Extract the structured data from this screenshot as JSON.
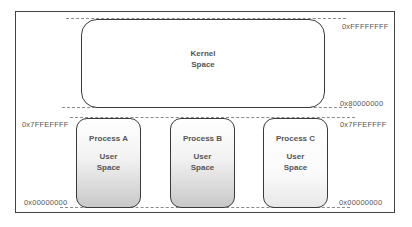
{
  "diagram": {
    "kernel": {
      "line1": "Kernel",
      "line2": "Space"
    },
    "processes": [
      {
        "name": "Process A",
        "line1": "User",
        "line2": "Space"
      },
      {
        "name": "Process B",
        "line1": "User",
        "line2": "Space"
      },
      {
        "name": "Process C",
        "line1": "User",
        "line2": "Space"
      }
    ],
    "addresses": {
      "kernel_top": "0xFFFFFFFF",
      "kernel_bottom": "0x80000000",
      "user_top_left": "0x7FFEFFFF",
      "user_top_right": "0x7FFEFFFF",
      "user_bottom_left": "0x00000000",
      "user_bottom_right": "0x00000000"
    }
  }
}
